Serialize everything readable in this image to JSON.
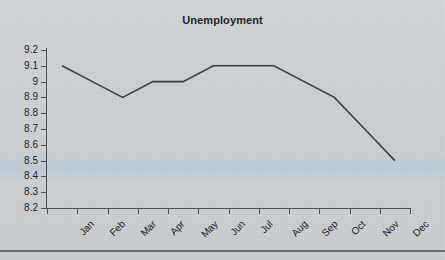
{
  "document": {
    "kind": "scanned-chart-page",
    "background_color": "#ced2d5",
    "bottom_rule_color": "#4e5356"
  },
  "chart_data": {
    "type": "line",
    "title": "Unemployment",
    "xlabel": "",
    "ylabel": "",
    "categories": [
      "Jan",
      "Feb",
      "Mar",
      "Apr",
      "May",
      "Jun",
      "Jul",
      "Aug",
      "Sep",
      "Oct",
      "Nov",
      "Dec"
    ],
    "values": [
      9.1,
      9.0,
      8.9,
      9.0,
      9.0,
      9.1,
      9.1,
      9.1,
      9.0,
      8.9,
      8.7,
      8.5
    ],
    "series": [
      {
        "name": "Unemployment",
        "values": [
          9.1,
          9.0,
          8.9,
          9.0,
          9.0,
          9.1,
          9.1,
          9.1,
          9.0,
          8.9,
          8.7,
          8.5
        ],
        "color": "#3a3f43"
      }
    ],
    "ylim": [
      8.2,
      9.2
    ],
    "ytick_step": 0.1,
    "ytick_labels": [
      "9.2",
      "9.1",
      "9",
      "8.9",
      "8.8",
      "8.7",
      "8.6",
      "8.5",
      "8.4",
      "8.3",
      "8.2"
    ],
    "ytick_values": [
      9.2,
      9.1,
      9.0,
      8.9,
      8.8,
      8.7,
      8.6,
      8.5,
      8.4,
      8.3,
      8.2
    ],
    "grid": false,
    "legend": false,
    "legend_position": "none",
    "xtick_label_rotation_deg": -45,
    "axis_color": "#4b5054",
    "text_color": "#1d2124",
    "line_color": "#3a3f43",
    "line_width": 1.6,
    "markers": false
  }
}
